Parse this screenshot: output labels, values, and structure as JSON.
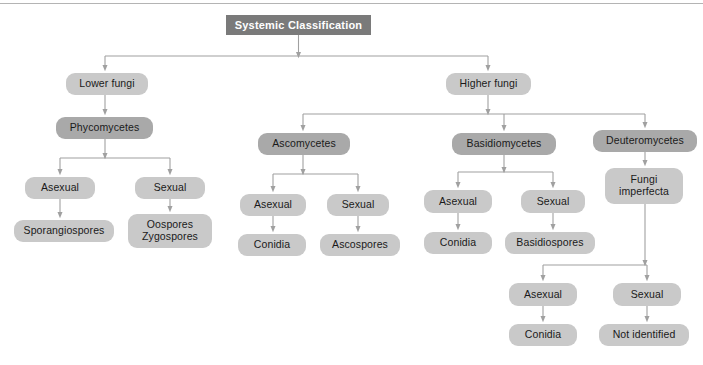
{
  "diagram": {
    "title": "Systemic Classification",
    "type": "flowchart",
    "tone_note": "grayscale tree diagram of fungal classification",
    "colors": {
      "title_box": "#7a7a7a",
      "title_text": "#ffffff",
      "node_light": "#c9c9c9",
      "node_dark": "#a9a9a9",
      "node_text": "#1a1a1a",
      "edge": "#a0a0a0",
      "background": "#ffffff"
    },
    "nodes": [
      {
        "id": "root",
        "label": "Systemic Classification",
        "style": "title",
        "x": 226,
        "y": 15,
        "w": 145,
        "h": 20
      },
      {
        "id": "lower",
        "label": "Lower fungi",
        "style": "light",
        "x": 66,
        "y": 73,
        "w": 82,
        "h": 22
      },
      {
        "id": "higher",
        "label": "Higher fungi",
        "style": "light",
        "x": 446,
        "y": 73,
        "w": 85,
        "h": 22
      },
      {
        "id": "phycomycetes",
        "label": "Phycomycetes",
        "style": "dark",
        "x": 56,
        "y": 117,
        "w": 97,
        "h": 22
      },
      {
        "id": "ascomycetes",
        "label": "Ascomycetes",
        "style": "dark",
        "x": 258,
        "y": 133,
        "w": 92,
        "h": 22
      },
      {
        "id": "basidiomycetes",
        "label": "Basidiomycetes",
        "style": "dark",
        "x": 452,
        "y": 133,
        "w": 104,
        "h": 22
      },
      {
        "id": "deuteromycetes",
        "label": "Deuteromycetes",
        "style": "dark",
        "x": 593,
        "y": 130,
        "w": 104,
        "h": 22
      },
      {
        "id": "phy-asex",
        "label": "Asexual",
        "style": "light",
        "x": 25,
        "y": 177,
        "w": 70,
        "h": 22
      },
      {
        "id": "phy-sex",
        "label": "Sexual",
        "style": "light",
        "x": 135,
        "y": 177,
        "w": 70,
        "h": 22
      },
      {
        "id": "sporangiospores",
        "label": "Sporangiospores",
        "style": "light",
        "x": 14,
        "y": 220,
        "w": 100,
        "h": 22
      },
      {
        "id": "oospores",
        "label": "Oospores\nZygospores",
        "style": "light",
        "x": 128,
        "y": 214,
        "w": 84,
        "h": 34
      },
      {
        "id": "asc-asex",
        "label": "Asexual",
        "style": "light",
        "x": 240,
        "y": 194,
        "w": 66,
        "h": 22
      },
      {
        "id": "asc-sex",
        "label": "Sexual",
        "style": "light",
        "x": 327,
        "y": 194,
        "w": 62,
        "h": 22
      },
      {
        "id": "asc-conidia",
        "label": "Conidia",
        "style": "light",
        "x": 238,
        "y": 234,
        "w": 68,
        "h": 22
      },
      {
        "id": "ascospores",
        "label": "Ascospores",
        "style": "light",
        "x": 320,
        "y": 234,
        "w": 80,
        "h": 22
      },
      {
        "id": "bas-asex",
        "label": "Asexual",
        "style": "light",
        "x": 424,
        "y": 190,
        "w": 68,
        "h": 23
      },
      {
        "id": "bas-sex",
        "label": "Sexual",
        "style": "light",
        "x": 521,
        "y": 190,
        "w": 64,
        "h": 23
      },
      {
        "id": "bas-conidia",
        "label": "Conidia",
        "style": "light",
        "x": 424,
        "y": 232,
        "w": 68,
        "h": 22
      },
      {
        "id": "basidiospores",
        "label": "Basidiospores",
        "style": "light",
        "x": 505,
        "y": 232,
        "w": 90,
        "h": 22
      },
      {
        "id": "fungi-imperfecta",
        "label": "Fungi\nimperfecta",
        "style": "light",
        "x": 605,
        "y": 168,
        "w": 78,
        "h": 36
      },
      {
        "id": "deu-asex",
        "label": "Asexual",
        "style": "light",
        "x": 509,
        "y": 283,
        "w": 68,
        "h": 23
      },
      {
        "id": "deu-sex",
        "label": "Sexual",
        "style": "light",
        "x": 613,
        "y": 283,
        "w": 68,
        "h": 23
      },
      {
        "id": "deu-conidia",
        "label": "Conidia",
        "style": "light",
        "x": 509,
        "y": 324,
        "w": 68,
        "h": 22
      },
      {
        "id": "not-identified",
        "label": "Not identified",
        "style": "light",
        "x": 599,
        "y": 324,
        "w": 90,
        "h": 22
      }
    ],
    "edges": [
      {
        "from": "root",
        "to": [
          "lower",
          "higher"
        ]
      },
      {
        "from": "lower",
        "to": [
          "phycomycetes"
        ]
      },
      {
        "from": "higher",
        "to": [
          "ascomycetes",
          "basidiomycetes",
          "deuteromycetes"
        ]
      },
      {
        "from": "phycomycetes",
        "to": [
          "phy-asex",
          "phy-sex"
        ]
      },
      {
        "from": "phy-asex",
        "to": [
          "sporangiospores"
        ]
      },
      {
        "from": "phy-sex",
        "to": [
          "oospores"
        ]
      },
      {
        "from": "ascomycetes",
        "to": [
          "asc-asex",
          "asc-sex"
        ]
      },
      {
        "from": "asc-asex",
        "to": [
          "asc-conidia"
        ]
      },
      {
        "from": "asc-sex",
        "to": [
          "ascospores"
        ]
      },
      {
        "from": "basidiomycetes",
        "to": [
          "bas-asex",
          "bas-sex"
        ]
      },
      {
        "from": "bas-asex",
        "to": [
          "bas-conidia"
        ]
      },
      {
        "from": "bas-sex",
        "to": [
          "basidiospores"
        ]
      },
      {
        "from": "deuteromycetes",
        "to": [
          "fungi-imperfecta"
        ]
      },
      {
        "from": "fungi-imperfecta",
        "to": [
          "deu-asex",
          "deu-sex"
        ]
      },
      {
        "from": "deu-asex",
        "to": [
          "deu-conidia"
        ]
      },
      {
        "from": "deu-sex",
        "to": [
          "not-identified"
        ]
      }
    ]
  }
}
